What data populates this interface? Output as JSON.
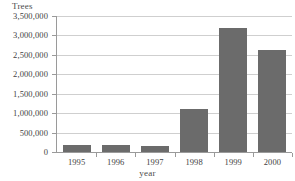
{
  "chart_data": {
    "type": "bar",
    "title": "",
    "xlabel": "year",
    "ylabel": "Trees",
    "categories": [
      "1995",
      "1996",
      "1997",
      "1998",
      "1999",
      "2000"
    ],
    "values": [
      170000,
      170000,
      160000,
      1100000,
      3200000,
      2620000
    ],
    "series": [
      {
        "name": "Trees",
        "values": [
          170000,
          170000,
          160000,
          1100000,
          3200000,
          2620000
        ]
      }
    ],
    "ylim": [
      0,
      3500000
    ],
    "ytick_step": 500000,
    "ytick_labels": [
      "3,500,000",
      "3,000,000",
      "2,500,000",
      "2,000,000",
      "1,500,000",
      "1,000,000",
      "500,000",
      "0"
    ],
    "ytick_values": [
      3500000,
      3000000,
      2500000,
      2000000,
      1500000,
      1000000,
      500000,
      0
    ],
    "grid": true,
    "grid_axis": "y",
    "legend": false,
    "bar_color": "#6b6b6b",
    "grid_color": "#cfcfcf",
    "axis_color": "#9a9a9a",
    "background_color": "#ffffff"
  }
}
